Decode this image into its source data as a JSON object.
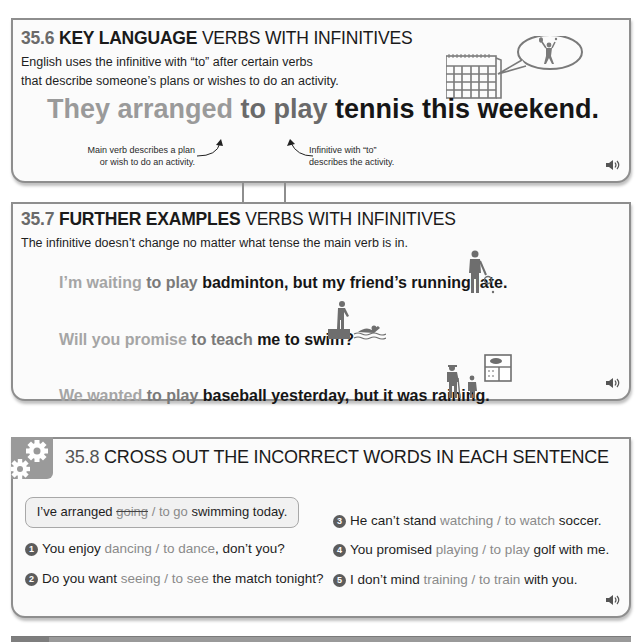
{
  "colors": {
    "border": "#8e8e8e",
    "main_verb": "#9a9a9a",
    "infinitive": "#6a6a6a",
    "rest": "#161616",
    "gear_tile": "#9a9a9a"
  },
  "section_356": {
    "number": "35.6",
    "keyword": "KEY LANGUAGE",
    "title": "VERBS WITH INFINITIVES",
    "intro_line1": "English uses the infinitive with “to” after certain verbs",
    "intro_line2": "that describe someone’s plans or wishes to do an activity.",
    "sentence": {
      "main": "They arranged ",
      "infinitive": "to play ",
      "rest": "tennis this weekend."
    },
    "note_left_line1": "Main verb describes a plan",
    "note_left_line2": "or wish to do an activity.",
    "note_right_line1": "Infinitive with “to”",
    "note_right_line2": "describes the activity.",
    "illustration": "calendar-with-tennis-player-thought-bubble",
    "audio_icon": "speaker-icon"
  },
  "section_357": {
    "number": "35.7",
    "keyword": "FURTHER EXAMPLES",
    "title": "VERBS WITH INFINITIVES",
    "intro": "The infinitive doesn’t change no matter what tense the main verb is in.",
    "examples": [
      {
        "main": "I’m waiting ",
        "infinitive": "to play ",
        "rest": "badminton, but my friend’s running late.",
        "illustration": "badminton-player"
      },
      {
        "main": "Will you promise ",
        "infinitive": "to teach ",
        "rest": "me to swim?",
        "illustration": "swimming-lesson"
      },
      {
        "main": "We wanted ",
        "infinitive": "to play ",
        "rest": "baseball yesterday, but it was raining.",
        "illustration": "baseball-rain-window"
      }
    ],
    "audio_icon": "speaker-icon"
  },
  "section_358": {
    "number": "35.8",
    "title": "CROSS OUT THE INCORRECT WORDS IN EACH SENTENCE",
    "icon": "gears-icon",
    "example": {
      "before": "I’ve arranged ",
      "crossed": "going",
      "slash": " / ",
      "answer": "to go",
      "after": " swimming today."
    },
    "questions": [
      {
        "n": "1",
        "before": "You enjoy ",
        "opt1": "dancing",
        "slash": " / ",
        "opt2": "to dance",
        "after": ", don’t you?"
      },
      {
        "n": "2",
        "before": "Do you want ",
        "opt1": "seeing",
        "slash": " / ",
        "opt2": "to see",
        "after": " the match tonight?"
      },
      {
        "n": "3",
        "before": "He can’t stand ",
        "opt1": "watching",
        "slash": " / ",
        "opt2": "to watch",
        "after": " soccer."
      },
      {
        "n": "4",
        "before": "You promised ",
        "opt1": "playing",
        "slash": " / ",
        "opt2": "to play",
        "after": " golf with me."
      },
      {
        "n": "5",
        "before": "I don’t mind ",
        "opt1": "training",
        "slash": " / ",
        "opt2": "to train",
        "after": " with you."
      }
    ],
    "audio_icon": "speaker-icon"
  }
}
